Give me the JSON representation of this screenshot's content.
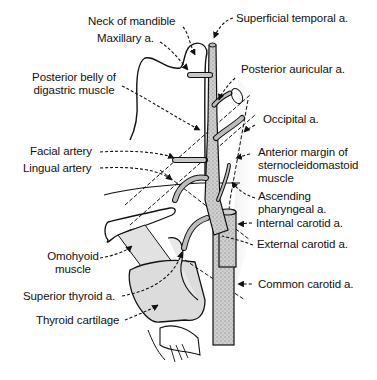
{
  "figure": {
    "type": "anatomical-illustration",
    "colors": {
      "line": "#111111",
      "artery_fill": "#bdbdbd",
      "muscle_shade": "#d9d9d9",
      "background": "#ffffff"
    }
  },
  "labels": {
    "neck_of_mandible": "Neck of mandible",
    "maxillary": "Maxillary a.",
    "posterior_belly_line1": "Posterior belly of",
    "posterior_belly_line2": "digastric muscle",
    "facial": "Facial artery",
    "lingual": "Lingual artery",
    "omohyoid_line1": "Omohyoid",
    "omohyoid_line2": "muscle",
    "superior_thyroid": "Superior thyroid a.",
    "thyroid_cartilage": "Thyroid cartilage",
    "superficial_temporal": "Superficial temporal a.",
    "posterior_auricular": "Posterior auricular a.",
    "occipital": "Occipital a.",
    "scm_line1": "Anterior margin of",
    "scm_line2": "sternocleidomastoid",
    "scm_line3": "muscle",
    "ascending_pharyngeal_line1": "Ascending",
    "ascending_pharyngeal_line2": "pharyngeal a.",
    "internal_carotid": "Internal carotid a.",
    "external_carotid": "External carotid a.",
    "common_carotid": "Common carotid a."
  }
}
